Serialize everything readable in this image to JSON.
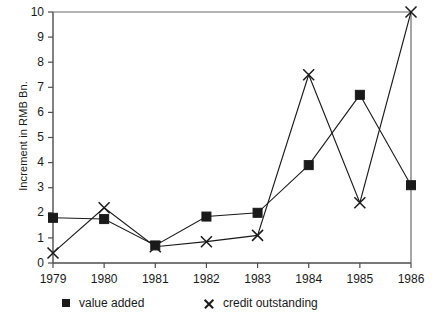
{
  "chart_data": {
    "type": "line",
    "title": "",
    "subtitle": "",
    "xlabel": "",
    "ylabel": "Increment in RMB Bn.",
    "categories": [
      "1979",
      "1980",
      "1981",
      "1982",
      "1983",
      "1984",
      "1985",
      "1986"
    ],
    "x": [
      1979,
      1980,
      1981,
      1982,
      1983,
      1984,
      1985,
      1986
    ],
    "xlim": [
      1979,
      1986
    ],
    "ylim": [
      0,
      10
    ],
    "yticks": [
      0,
      1,
      2,
      3,
      4,
      5,
      6,
      7,
      8,
      9,
      10
    ],
    "ytick_labels": [
      "0",
      "1",
      "2",
      "3",
      "4",
      "5",
      "6",
      "7",
      "8",
      "9",
      "10"
    ],
    "xtick_labels": [
      "1979",
      "1980",
      "1981",
      "1982",
      "1983",
      "1984",
      "1985",
      "1986"
    ],
    "grid": false,
    "legend_position": "bottom",
    "series": [
      {
        "name": "value added",
        "marker": "square",
        "color": "#1a1a1a",
        "values": [
          1.8,
          1.75,
          0.7,
          1.85,
          2.0,
          3.9,
          6.7,
          3.1
        ]
      },
      {
        "name": "credit outstanding",
        "marker": "cross",
        "color": "#1a1a1a",
        "values": [
          0.4,
          2.2,
          0.65,
          0.85,
          1.1,
          7.5,
          2.4,
          10.0
        ]
      }
    ]
  },
  "axis": {
    "y_title": "Increment in RMB Bn."
  },
  "legend": {
    "items": [
      {
        "label": "value added",
        "marker": "square"
      },
      {
        "label": "credit outstanding",
        "marker": "cross"
      }
    ]
  }
}
